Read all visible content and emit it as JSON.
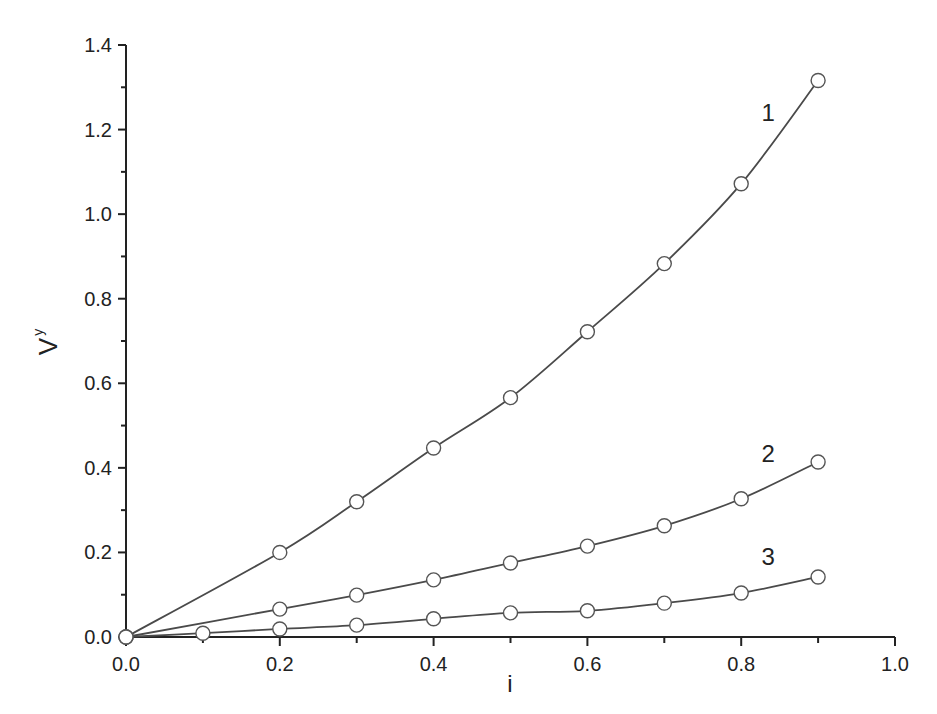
{
  "chart_data": {
    "type": "line",
    "title": "",
    "xlabel": "i",
    "ylabel": "V",
    "ylabel_subscript": "y",
    "xlim": [
      0.0,
      1.0
    ],
    "ylim": [
      0.0,
      1.4
    ],
    "xticks": [
      0.0,
      0.2,
      0.4,
      0.6,
      0.8,
      1.0
    ],
    "xtick_labels": [
      "0.0",
      "0.2",
      "0.4",
      "0.6",
      "0.8",
      "1.0"
    ],
    "yticks": [
      0.0,
      0.2,
      0.4,
      0.6,
      0.8,
      1.0,
      1.2,
      1.4
    ],
    "ytick_labels": [
      "0.0",
      "0.2",
      "0.4",
      "0.6",
      "0.8",
      "1.0",
      "1.2",
      "1.4"
    ],
    "grid": false,
    "legend": "inline curve labels",
    "marker": "open-circle",
    "series": [
      {
        "name": "1",
        "x": [
          0.0,
          0.2,
          0.3,
          0.4,
          0.5,
          0.6,
          0.7,
          0.8,
          0.9
        ],
        "values": [
          0.0,
          0.2,
          0.32,
          0.447,
          0.566,
          0.722,
          0.883,
          1.072,
          1.316
        ],
        "label_pos": [
          0.835,
          1.22
        ]
      },
      {
        "name": "2",
        "x": [
          0.0,
          0.2,
          0.3,
          0.4,
          0.5,
          0.6,
          0.7,
          0.8,
          0.9
        ],
        "values": [
          0.0,
          0.066,
          0.099,
          0.135,
          0.175,
          0.215,
          0.263,
          0.327,
          0.414
        ],
        "label_pos": [
          0.835,
          0.415
        ]
      },
      {
        "name": "3",
        "x": [
          0.0,
          0.1,
          0.2,
          0.3,
          0.4,
          0.5,
          0.6,
          0.7,
          0.8,
          0.9
        ],
        "values": [
          0.0,
          0.009,
          0.019,
          0.028,
          0.043,
          0.057,
          0.062,
          0.08,
          0.104,
          0.142
        ],
        "label_pos": [
          0.835,
          0.17
        ]
      }
    ]
  },
  "colors": {
    "line": "#4a4a4a",
    "axis": "#222222",
    "marker_fill": "#ffffff"
  }
}
